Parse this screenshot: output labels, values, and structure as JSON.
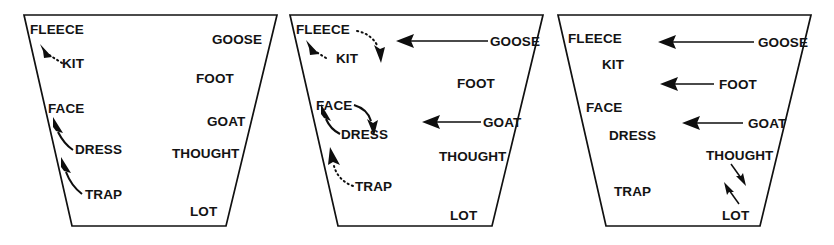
{
  "figure": {
    "type": "vowel-trapezoid-series",
    "panel_count": 3,
    "background_color": "#ffffff",
    "line_color": "#111111",
    "text_color": "#131313"
  },
  "panels": [
    {
      "id": "panel-1",
      "name": "panel-1",
      "labels": {
        "fleece": "FLEECE",
        "kit": "KIT",
        "face": "FACE",
        "dress": "DRESS",
        "trap": "TRAP",
        "goose": "GOOSE",
        "foot": "FOOT",
        "goat": "GOAT",
        "thought": "THOUGHT",
        "lot": "LOT"
      },
      "arrows": [
        {
          "name": "arrow-kit-to-fleece",
          "from": "KIT",
          "to": "FLEECE",
          "style": "dotted",
          "direction": "up-left"
        },
        {
          "name": "arrow-dress-to-face",
          "from": "DRESS",
          "to": "FACE",
          "style": "solid",
          "direction": "up-left"
        },
        {
          "name": "arrow-trap-to-dress",
          "from": "TRAP",
          "to": "DRESS",
          "style": "solid",
          "direction": "up-left"
        }
      ]
    },
    {
      "id": "panel-2",
      "name": "panel-2",
      "labels": {
        "fleece": "FLEECE",
        "kit": "KIT",
        "face": "FACE",
        "dress": "DRESS",
        "trap": "TRAP",
        "goose": "GOOSE",
        "foot": "FOOT",
        "goat": "GOAT",
        "thought": "THOUGHT",
        "lot": "LOT"
      },
      "arrows": [
        {
          "name": "arrow-kit-to-fleece",
          "from": "KIT",
          "to": "FLEECE",
          "style": "dotted",
          "direction": "up-left"
        },
        {
          "name": "arrow-fleece-to-kit",
          "from": "FLEECE",
          "to": "KIT",
          "style": "dotted",
          "direction": "down-right"
        },
        {
          "name": "arrow-dress-to-face",
          "from": "DRESS",
          "to": "FACE",
          "style": "solid",
          "direction": "up-left"
        },
        {
          "name": "arrow-face-to-dress",
          "from": "FACE",
          "to": "DRESS",
          "style": "solid",
          "direction": "down-right"
        },
        {
          "name": "arrow-trap-to-dress",
          "from": "TRAP",
          "to": "DRESS",
          "style": "dotted",
          "direction": "up-left"
        },
        {
          "name": "arrow-goose-fronting",
          "from": "GOOSE",
          "to": "front",
          "style": "solid",
          "direction": "left"
        },
        {
          "name": "arrow-goat-fronting",
          "from": "GOAT",
          "to": "front",
          "style": "solid",
          "direction": "left"
        }
      ]
    },
    {
      "id": "panel-3",
      "name": "panel-3",
      "labels": {
        "fleece": "FLEECE",
        "kit": "KIT",
        "face": "FACE",
        "dress": "DRESS",
        "trap": "TRAP",
        "goose": "GOOSE",
        "foot": "FOOT",
        "goat": "GOAT",
        "thought": "THOUGHT",
        "lot": "LOT"
      },
      "arrows": [
        {
          "name": "arrow-goose-fronting",
          "from": "GOOSE",
          "to": "front",
          "style": "solid",
          "direction": "left"
        },
        {
          "name": "arrow-foot-fronting",
          "from": "FOOT",
          "to": "front",
          "style": "solid",
          "direction": "left"
        },
        {
          "name": "arrow-goat-fronting",
          "from": "GOAT",
          "to": "front",
          "style": "solid",
          "direction": "left"
        },
        {
          "name": "arrow-thought-lowering",
          "from": "THOUGHT",
          "to": "LOT",
          "style": "solid-thin",
          "direction": "down"
        },
        {
          "name": "arrow-lot-raising",
          "from": "LOT",
          "to": "THOUGHT",
          "style": "solid-thin",
          "direction": "up"
        }
      ]
    }
  ]
}
